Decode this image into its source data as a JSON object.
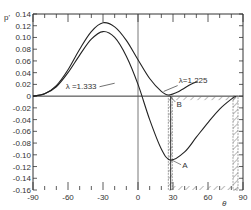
{
  "chart_data": {
    "type": "line",
    "title": "",
    "xlabel": "θ",
    "ylabel": "p'",
    "xlim": [
      -90,
      90
    ],
    "ylim": [
      -0.16,
      0.14
    ],
    "x_ticks": [
      -90,
      -60,
      -30,
      0,
      30,
      60,
      90
    ],
    "y_ticks": [
      0.14,
      0.12,
      0.1,
      0.08,
      0.06,
      0.04,
      0.02,
      0,
      -0.02,
      -0.04,
      -0.06,
      -0.08,
      -0.1,
      -0.12,
      -0.14,
      -0.16
    ],
    "y_tick_labels": [
      "0.14",
      "0.12",
      "0.10",
      "0.08",
      "0.06",
      "0.04",
      "0.02",
      "0",
      "-0.02",
      "-0.04",
      "-0.06",
      "-0.08",
      "-0.10",
      "-0.12",
      "-0.14",
      "-0.16"
    ],
    "x_tick_labels": [
      "-90",
      "-60",
      "-30",
      "0",
      "30",
      "60",
      "90"
    ],
    "grid": false,
    "series": [
      {
        "name": "λ=1.225",
        "x": [
          -90,
          -80,
          -70,
          -60,
          -50,
          -40,
          -30,
          -20,
          -10,
          0,
          10,
          20,
          26,
          35,
          45,
          51
        ],
        "y": [
          0,
          0.004,
          0.018,
          0.045,
          0.08,
          0.11,
          0.125,
          0.118,
          0.095,
          0.062,
          0.03,
          0.008,
          0.002,
          0.008,
          0.02,
          0.025
        ]
      },
      {
        "name": "λ=1.333",
        "x": [
          -90,
          -80,
          -70,
          -60,
          -50,
          -40,
          -30,
          -20,
          -10,
          0,
          10,
          20,
          28,
          40,
          50,
          60,
          70,
          80,
          84
        ],
        "y": [
          0,
          0.004,
          0.016,
          0.04,
          0.07,
          0.097,
          0.11,
          0.1,
          0.068,
          0.02,
          -0.04,
          -0.09,
          -0.109,
          -0.095,
          -0.07,
          -0.045,
          -0.022,
          -0.005,
          0
        ]
      }
    ],
    "annotations": [
      {
        "text": "λ =1.333",
        "x": -18,
        "y": 0.016
      },
      {
        "text": "λ=1.225",
        "x": 40,
        "y": 0.022
      },
      {
        "text": "B",
        "x": 33,
        "y": -0.01,
        "points_to": [
          26,
          0.002
        ]
      },
      {
        "text": "A",
        "x": 38,
        "y": -0.118,
        "points_to": [
          28,
          -0.109
        ]
      }
    ],
    "hatched_regions": [
      {
        "x": [
          26,
          84
        ],
        "y": [
          -0.16,
          0
        ],
        "description": "hatched boundary region from θ≈26 to θ≈84"
      }
    ]
  },
  "labels": {
    "ylabel": "p'",
    "xlabel": "θ",
    "lambda_1333": "λ =1.333",
    "lambda_1225": "λ=1.225",
    "point_a": "A",
    "point_b": "B"
  }
}
